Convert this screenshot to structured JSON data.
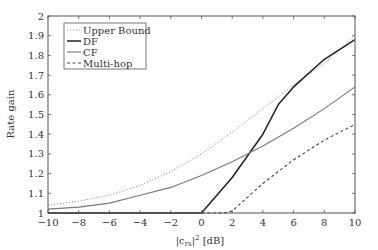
{
  "chart_data": {
    "type": "line",
    "title": "",
    "xlabel": "|c_rs|^2 [dB]",
    "xlabel_main": "|c",
    "xlabel_sub": "rs",
    "xlabel_sup": "2",
    "xlabel_tail": " [dB]",
    "ylabel": "Rate gain",
    "xlim": [
      -10,
      10
    ],
    "ylim": [
      1,
      2
    ],
    "grid": false,
    "legend_position": "upper left",
    "x_ticks": [
      -10,
      -8,
      -6,
      -4,
      -2,
      0,
      2,
      4,
      6,
      8,
      10
    ],
    "x_tick_labels": [
      "−10",
      "−8",
      "−6",
      "−4",
      "−2",
      "0",
      "2",
      "4",
      "6",
      "8",
      "10"
    ],
    "y_ticks": [
      1,
      1.1,
      1.2,
      1.3,
      1.4,
      1.5,
      1.6,
      1.7,
      1.8,
      1.9,
      2
    ],
    "y_tick_labels": [
      "1",
      "1.1",
      "1.2",
      "1.3",
      "1.4",
      "1.5",
      "1.6",
      "1.7",
      "1.8",
      "1.9",
      "2"
    ],
    "series": [
      {
        "name": "Upper Bound",
        "style": "dotted",
        "color": "#888888",
        "x": [
          -10,
          -8,
          -6,
          -4,
          -2,
          0,
          2,
          4,
          6,
          8,
          10
        ],
        "y": [
          1.04,
          1.06,
          1.09,
          1.14,
          1.21,
          1.3,
          1.41,
          1.53,
          1.65,
          1.76,
          1.9
        ]
      },
      {
        "name": "DF",
        "style": "solid-thick",
        "color": "#222222",
        "x": [
          -10,
          -8,
          -6,
          -4,
          -2,
          0,
          2,
          4,
          5,
          6,
          8,
          10
        ],
        "y": [
          1.0,
          1.0,
          1.0,
          1.0,
          1.0,
          1.0,
          1.18,
          1.4,
          1.55,
          1.64,
          1.78,
          1.88
        ]
      },
      {
        "name": "CF",
        "style": "solid",
        "color": "#777777",
        "x": [
          -10,
          -8,
          -6,
          -4,
          -2,
          0,
          2,
          4,
          6,
          8,
          10
        ],
        "y": [
          1.02,
          1.03,
          1.05,
          1.09,
          1.13,
          1.19,
          1.26,
          1.34,
          1.43,
          1.53,
          1.64
        ]
      },
      {
        "name": "Multi-hop",
        "style": "dashed",
        "color": "#444444",
        "x": [
          -10,
          -8,
          -6,
          -4,
          -2,
          0,
          1.5,
          2,
          4,
          6,
          8,
          10
        ],
        "y": [
          1.0,
          1.0,
          1.0,
          1.0,
          1.0,
          1.0,
          1.0,
          1.01,
          1.15,
          1.27,
          1.37,
          1.45
        ]
      }
    ]
  }
}
